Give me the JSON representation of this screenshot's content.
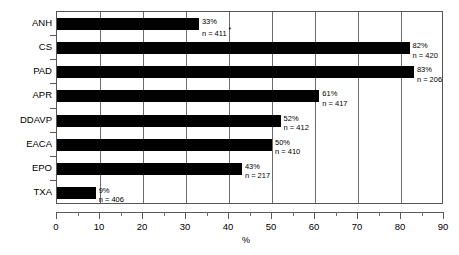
{
  "chart_data": {
    "type": "bar",
    "orientation": "horizontal",
    "title": "",
    "xlabel": "%",
    "ylabel": "",
    "xlim": [
      0,
      90
    ],
    "xticks": [
      0,
      10,
      20,
      30,
      40,
      50,
      60,
      70,
      80,
      90
    ],
    "xtick_labels": [
      "0",
      "10",
      "20",
      "30",
      "40",
      "50",
      "60",
      "70",
      "80",
      "90"
    ],
    "minor_ticks_between": 1,
    "grid": true,
    "grid_axis": "x",
    "legend": null,
    "bar_color": "#000000",
    "categories": [
      "ANH",
      "CS",
      "PAD",
      "APR",
      "DDAVP",
      "EACA",
      "EPO",
      "TXA"
    ],
    "values": [
      33,
      82,
      83,
      61,
      52,
      50,
      43,
      9
    ],
    "value_labels": [
      "33%",
      "82%",
      "83%",
      "61%",
      "52%",
      "50%",
      "43%",
      "9%"
    ],
    "n_labels": [
      "n = 411",
      "n = 420",
      "n = 206",
      "n = 417",
      "n = 412",
      "n = 410",
      "n = 217",
      "n = 406"
    ],
    "n_values": [
      411,
      420,
      206,
      417,
      412,
      410,
      217,
      406
    ],
    "annotations": [
      {
        "category": "ANH",
        "marker": "*",
        "attached_to": "n = 411"
      }
    ],
    "points": [
      {
        "category": "ANH",
        "value": 33,
        "value_label": "33%",
        "n_label": "n = 411",
        "marker": "*"
      },
      {
        "category": "CS",
        "value": 82,
        "value_label": "82%",
        "n_label": "n = 420",
        "marker": ""
      },
      {
        "category": "PAD",
        "value": 83,
        "value_label": "83%",
        "n_label": "n = 206",
        "marker": ""
      },
      {
        "category": "APR",
        "value": 61,
        "value_label": "61%",
        "n_label": "n = 417",
        "marker": ""
      },
      {
        "category": "DDAVP",
        "value": 52,
        "value_label": "52%",
        "n_label": "n = 412",
        "marker": ""
      },
      {
        "category": "EACA",
        "value": 50,
        "value_label": "50%",
        "n_label": "n = 410",
        "marker": ""
      },
      {
        "category": "EPO",
        "value": 43,
        "value_label": "43%",
        "n_label": "n = 217",
        "marker": ""
      },
      {
        "category": "TXA",
        "value": 9,
        "value_label": "9%",
        "n_label": "n = 406",
        "marker": ""
      }
    ]
  }
}
